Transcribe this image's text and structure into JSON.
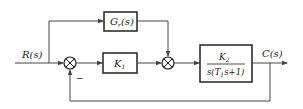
{
  "diagram": {
    "type": "control-system-block-diagram",
    "input_label": "R(s)",
    "output_label": "C(s)",
    "blocks": {
      "feedforward": {
        "main": "G",
        "subscript": "r",
        "arg": "(s)"
      },
      "controller": {
        "main": "K",
        "subscript": "1"
      },
      "plant": {
        "numerator": {
          "main": "K",
          "subscript": "2"
        },
        "denominator": {
          "prefix": "s(T",
          "subscript": "1",
          "suffix": "s+1)"
        }
      }
    },
    "summing_junctions": [
      {
        "id": "sum1",
        "feedback_sign": "−"
      },
      {
        "id": "sum2"
      }
    ],
    "colors": {
      "line": "#444444",
      "block_border": "#222222"
    }
  }
}
